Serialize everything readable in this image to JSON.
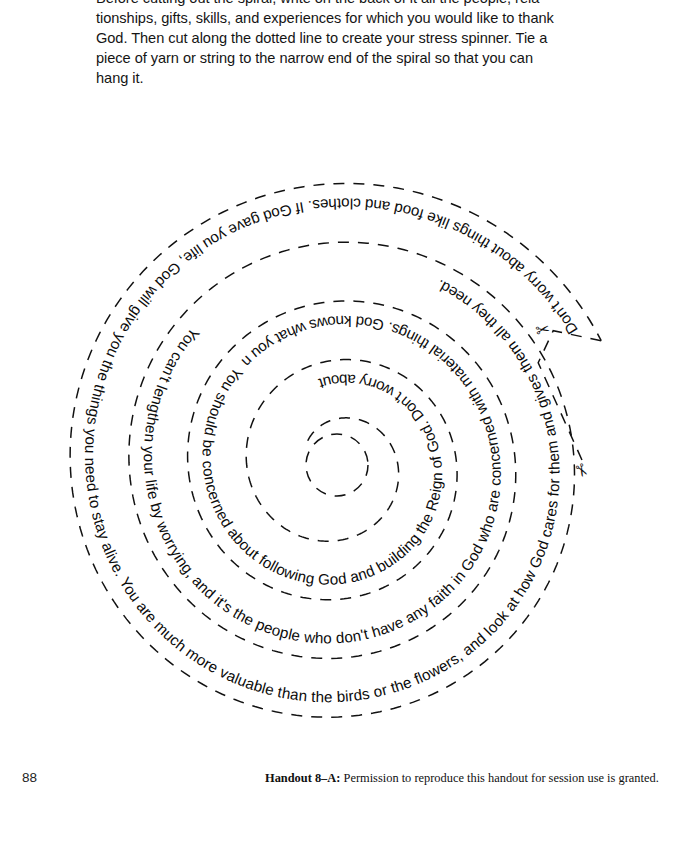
{
  "intro": {
    "lines": [
      "Before cutting out the spiral, write on the back of it all the people, rela-",
      "tionships, gifts, skills, and experiences for which you would like to thank",
      "God. Then cut along the dotted line to create your stress spinner. Tie a",
      "piece of yarn or string to the narrow end of the spiral so that you can",
      "hang it."
    ]
  },
  "spiral": {
    "title": "stress-spinner-spiral",
    "full_text": "Don't worry about things like food and clothes. If God gave you life, God will give you the things you need to stay alive. You are much more valuable than the birds or the flowers, and look at how God cares for them and gives them all they need. You can't lengthen your life by worrying, and it's the people who don't have any faith in God who are concerned with material things. God knows what you need and will provide it. You should be concerned about following God and building the Reign of God. Don't worry about tomorrow. You have enough to think about today.",
    "turns": [
      {
        "index": 1,
        "text": "Don't worry about things like food and clothes. If God gave you life, God will give you the things you need to stay alive. You are much more valuable than the birds or the flowers, and look at how God cares for them and gives them all they need."
      },
      {
        "index": 2,
        "text": "You can't lengthen your life by worrying, and it's the people who don't have any faith in God who are concerned with material things. God knows what you need and will provide it."
      },
      {
        "index": 3,
        "text": "You should be concerned about following God and building the Reign of God. Don't worry about tomorrow. You have enough to think about today."
      }
    ],
    "cut_line_label": "cut-here-lead-in-line",
    "scissors": [
      {
        "name": "scissors-icon-top",
        "glyph": "✂"
      },
      {
        "name": "scissors-icon-lower",
        "glyph": "✂"
      }
    ],
    "line_color": "#111111",
    "text_color": "#0b0b0b"
  },
  "footer": {
    "page_number": "88",
    "credit_label": "Handout 8–A:",
    "credit_text": "Permission to reproduce this handout for session use is granted."
  }
}
